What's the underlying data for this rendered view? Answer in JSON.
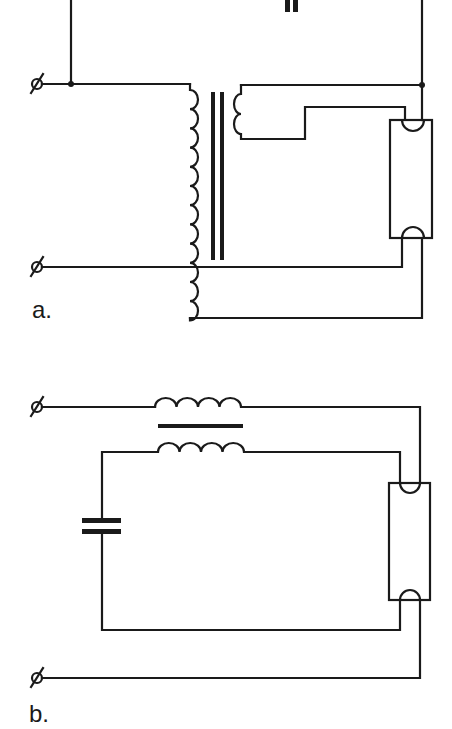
{
  "figure": {
    "panels": [
      {
        "id": "a",
        "label": "a.",
        "description": "Fluorescent lamp circuit with autotransformer (tapped primary) and heater secondary winding, with capacitor in top branch",
        "components": [
          "terminal",
          "terminal",
          "autotransformer-primary",
          "iron-core",
          "heater-secondary-winding",
          "capacitor",
          "fluorescent-tube"
        ]
      },
      {
        "id": "b",
        "label": "b.",
        "description": "Fluorescent lamp circuit with coupled inductor ballast (two windings on a common core) and series capacitor",
        "components": [
          "terminal",
          "terminal",
          "inductor-upper",
          "iron-core",
          "inductor-lower",
          "capacitor",
          "fluorescent-tube"
        ]
      }
    ],
    "terminal_symbol": "ø",
    "colors": {
      "ink": "#1a1a1a",
      "background": "#ffffff"
    }
  }
}
